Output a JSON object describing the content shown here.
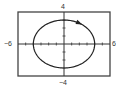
{
  "chart_data": {
    "type": "line",
    "subtype": "parametric",
    "title": "",
    "xlabel": "",
    "ylabel": "",
    "xlim": [
      -6,
      6
    ],
    "ylim": [
      -4,
      4
    ],
    "tick_labels": {
      "x_min": "−6",
      "x_max": "6",
      "y_min": "−4",
      "y_max": "4"
    },
    "grid": false,
    "legend": null,
    "axes_ticks_every": 1,
    "series": [
      {
        "name": "ellipse",
        "equation": "x = 4cos t, y = 3sin t",
        "direction": "clockwise",
        "x": [
          4,
          3.46,
          2,
          0,
          -2,
          -3.46,
          -4,
          -3.46,
          -2,
          0,
          2,
          3.46,
          4
        ],
        "y": [
          0,
          1.5,
          2.6,
          3,
          2.6,
          1.5,
          0,
          -1.5,
          -2.6,
          -3,
          -2.6,
          -1.5,
          0
        ]
      }
    ],
    "annotations": [
      "direction arrow on upper-right arc"
    ]
  },
  "colors": {
    "curve": "#222222",
    "frame": "#444444",
    "axis": "#333333"
  }
}
